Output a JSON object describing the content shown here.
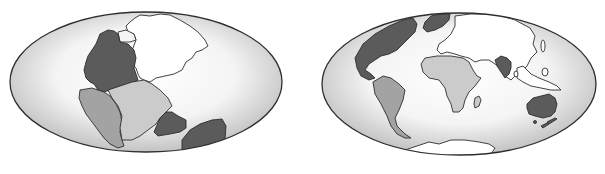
{
  "figure": {
    "panels": [
      {
        "id": "left",
        "label": "",
        "era": "pangaea",
        "regions": [
          {
            "name": "laurasia-north",
            "shade": "white"
          },
          {
            "name": "north-america",
            "shade": "dark"
          },
          {
            "name": "south-america",
            "shade": "medium"
          },
          {
            "name": "africa",
            "shade": "light"
          },
          {
            "name": "india",
            "shade": "dark"
          },
          {
            "name": "australia-antarctica",
            "shade": "dark"
          }
        ]
      },
      {
        "id": "right",
        "label": "",
        "era": "present-day",
        "regions": [
          {
            "name": "north-america",
            "shade": "dark"
          },
          {
            "name": "greenland",
            "shade": "dark"
          },
          {
            "name": "eurasia",
            "shade": "white"
          },
          {
            "name": "south-america",
            "shade": "medium"
          },
          {
            "name": "africa",
            "shade": "light"
          },
          {
            "name": "madagascar",
            "shade": "light"
          },
          {
            "name": "india",
            "shade": "dark"
          },
          {
            "name": "southeast-asia-islands",
            "shade": "white"
          },
          {
            "name": "australia",
            "shade": "dark"
          },
          {
            "name": "new-zealand",
            "shade": "dark"
          },
          {
            "name": "antarctica",
            "shade": "white"
          }
        ]
      }
    ],
    "colors": {
      "dark": "#5b5b5b",
      "medium": "#a3a3a3",
      "light": "#cbcbcb",
      "white": "#ffffff",
      "outline": "#2e2e2e",
      "ocean_center": "#ffffff",
      "ocean_edge": "#bdbdbd"
    }
  }
}
